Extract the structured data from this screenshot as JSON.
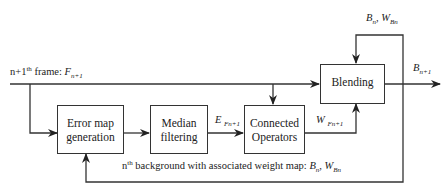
{
  "diagram": {
    "nodes": {
      "error_map": {
        "line1": "Error  map",
        "line2": "generation"
      },
      "median": {
        "line1": "Median",
        "line2": "filtering"
      },
      "connected": {
        "line1": "Connected",
        "line2": "Operators"
      },
      "blending": {
        "label": "Blending"
      }
    },
    "labels": {
      "input_prefix": "n+1",
      "input_sup": "th",
      "input_mid": " frame: ",
      "input_var": "F",
      "input_sub": "n+1",
      "feedback_top_b": "B",
      "feedback_top_b_sub": "n",
      "feedback_top_sep": ", ",
      "feedback_top_w": "W",
      "feedback_top_w_sub": "Bn",
      "output_var": "B",
      "output_sub": "n+1",
      "error_var": "E",
      "error_sub": "Fn+1",
      "weight_var": "W",
      "weight_sub": "Fn+1",
      "bottom_prefix": "n",
      "bottom_sup": "th",
      "bottom_text": " background with associated weight map: ",
      "bottom_b": "B",
      "bottom_b_sub": "n",
      "bottom_sep": ", ",
      "bottom_w": "W",
      "bottom_w_sub": "Bn"
    },
    "edges": [
      {
        "from": "input",
        "to": "blending"
      },
      {
        "from": "input",
        "to": "error_map"
      },
      {
        "from": "input",
        "to": "connected"
      },
      {
        "from": "error_map",
        "to": "median"
      },
      {
        "from": "median",
        "to": "connected",
        "label": "E Fn+1"
      },
      {
        "from": "connected",
        "to": "blending",
        "label": "W Fn+1"
      },
      {
        "from": "blending",
        "to": "output",
        "label": "Bn+1"
      },
      {
        "from": "output",
        "to": "blending",
        "label": "Bn, WBn"
      },
      {
        "from": "output",
        "to": "error_map",
        "label": "nth background with associated weight map: Bn, WBn"
      }
    ]
  }
}
